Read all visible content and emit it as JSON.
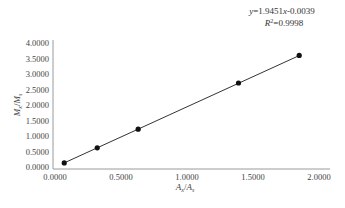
{
  "chart_data": {
    "type": "scatter",
    "title": "",
    "xlabel": "Ax/As",
    "ylabel": "Mx/Ms",
    "xlabel_parts": {
      "num": "A",
      "num_sub": "x",
      "den": "A",
      "den_sub": "s"
    },
    "ylabel_parts": {
      "num": "M",
      "num_sub": "x",
      "den": "M",
      "den_sub": "s"
    },
    "xlim": [
      0,
      2
    ],
    "ylim": [
      0,
      4
    ],
    "x_ticks": [
      "0.0000",
      "0.5000",
      "1.0000",
      "1.5000",
      "2.0000"
    ],
    "y_ticks": [
      "0.0000",
      "0.5000",
      "1.0000",
      "1.5000",
      "2.0000",
      "2.5000",
      "3.0000",
      "3.5000",
      "4.0000"
    ],
    "grid": false,
    "legend": null,
    "series": [
      {
        "name": "calibration points",
        "marker": "circle",
        "color": "#111111",
        "x": [
          0.07,
          0.32,
          0.63,
          1.39,
          1.85
        ],
        "y": [
          0.13,
          0.62,
          1.22,
          2.71,
          3.6
        ]
      }
    ],
    "trendline": {
      "type": "linear",
      "slope": 1.9451,
      "intercept": -0.0039,
      "r_squared": 0.9998,
      "x_range": [
        0.07,
        1.85
      ],
      "color": "#333333"
    },
    "annotations": [
      "y=1.9451x-0.0039",
      "R²=0.9998"
    ]
  },
  "equation": {
    "y": "y",
    "eq_text": "=1.9451",
    "x": "x",
    "tail": "-0.0039",
    "r": "R",
    "r_sup": "2",
    "r_val": "=0.9998"
  }
}
